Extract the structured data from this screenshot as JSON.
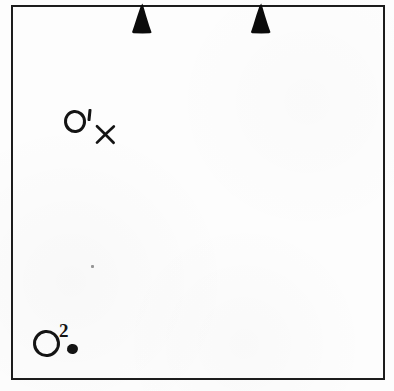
{
  "figure": {
    "background_color": "#fdfdfd",
    "ink_color": "#141414",
    "width": 394,
    "height": 391
  },
  "frame": {
    "name": "outer-frame-rectangle",
    "left": 11,
    "top": 5,
    "width": 374,
    "height": 375,
    "stroke_color": "#1b1b1b",
    "stroke_width": 2
  },
  "triangles": [
    {
      "label": "triangle-marker-left",
      "left": 130,
      "top": 3,
      "width": 24,
      "height": 31,
      "fill": "#0b0b0b",
      "orientation": "apex-up"
    },
    {
      "label": "triangle-marker-right",
      "left": 249,
      "top": 3,
      "width": 24,
      "height": 31,
      "fill": "#0b0b0b",
      "orientation": "apex-up"
    }
  ],
  "marks": [
    {
      "id": "mark-o-prime",
      "letter": "O",
      "annotation": "′",
      "annotation_kind": "prime",
      "companion_symbol": "X",
      "circle": {
        "left": 64,
        "top": 110,
        "size": 22,
        "stroke": 3
      },
      "prime": {
        "left": 88,
        "top": 109,
        "width": 3,
        "height": 12
      },
      "cross": {
        "left": 95,
        "top": 124,
        "size": 21
      }
    },
    {
      "id": "mark-o-two",
      "letter": "O",
      "annotation": "2",
      "annotation_kind": "superscript",
      "companion_symbol": "•",
      "circle": {
        "left": 33,
        "top": 330,
        "size": 27,
        "stroke": 3
      },
      "superscript": {
        "left": 59,
        "top": 322,
        "font_size": 19
      },
      "dot": {
        "left": 67,
        "top": 344,
        "size": 11
      }
    }
  ],
  "artifacts": [
    {
      "id": "scan-speck",
      "left": 91,
      "top": 265,
      "width": 3,
      "height": 3
    }
  ]
}
